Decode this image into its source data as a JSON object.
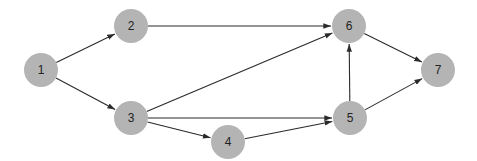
{
  "diagram": {
    "type": "directed-graph",
    "node_color": "#b4b4b4",
    "edge_color": "#2a2a2a",
    "node_radius": 17,
    "nodes": [
      {
        "id": "1",
        "label": "1",
        "x": 41,
        "y": 70
      },
      {
        "id": "2",
        "label": "2",
        "x": 131,
        "y": 26
      },
      {
        "id": "3",
        "label": "3",
        "x": 131,
        "y": 118
      },
      {
        "id": "4",
        "label": "4",
        "x": 228,
        "y": 142
      },
      {
        "id": "5",
        "label": "5",
        "x": 350,
        "y": 118
      },
      {
        "id": "6",
        "label": "6",
        "x": 349,
        "y": 26
      },
      {
        "id": "7",
        "label": "7",
        "x": 438,
        "y": 70
      }
    ],
    "edges": [
      {
        "from": "1",
        "to": "2"
      },
      {
        "from": "1",
        "to": "3"
      },
      {
        "from": "2",
        "to": "6"
      },
      {
        "from": "3",
        "to": "6"
      },
      {
        "from": "3",
        "to": "5"
      },
      {
        "from": "3",
        "to": "4"
      },
      {
        "from": "4",
        "to": "5"
      },
      {
        "from": "5",
        "to": "6"
      },
      {
        "from": "5",
        "to": "7"
      },
      {
        "from": "6",
        "to": "7"
      }
    ]
  }
}
